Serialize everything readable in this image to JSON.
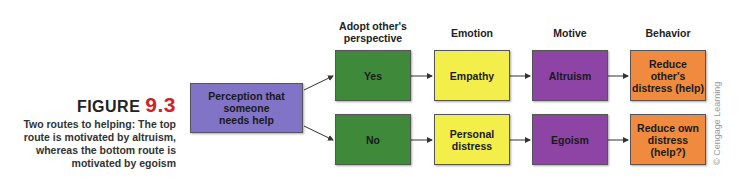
{
  "figure": {
    "label": "FIGURE",
    "number": "9.3",
    "caption_lines": [
      "Two routes to helping: The top",
      "route is motivated by altruism,",
      "whereas the bottom route is",
      "motivated by egoism"
    ]
  },
  "headers": {
    "perspective": [
      "Adopt other's",
      "perspective"
    ],
    "emotion": "Emotion",
    "motive": "Motive",
    "behavior": "Behavior"
  },
  "boxes": {
    "start": [
      "Perception that someone",
      "needs help"
    ],
    "top": {
      "perspective": "Yes",
      "emotion": "Empathy",
      "motive": "Altruism",
      "behavior": [
        "Reduce other's",
        "distress (help)"
      ]
    },
    "bottom": {
      "perspective": "No",
      "emotion": [
        "Personal",
        "distress"
      ],
      "motive": "Egoism",
      "behavior": [
        "Reduce own",
        "distress (help?)"
      ]
    }
  },
  "colors": {
    "start": "#8173c6",
    "perspective": "#3f8a3a",
    "emotion": "#f4ee4a",
    "motive": "#8e44a5",
    "behavior": "#ef8a3f",
    "figure_number": "#d0222a"
  },
  "credit": "© Cengage Learning"
}
